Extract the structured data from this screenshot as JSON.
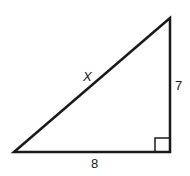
{
  "diagram": {
    "type": "right-triangle",
    "shape": {
      "vertices": {
        "bottom_left": [
          14,
          152
        ],
        "top_right": [
          170,
          18
        ],
        "bottom_right": [
          170,
          152
        ]
      },
      "right_angle_at": "bottom_right",
      "stroke_color": "#1a1a1a",
      "fill_color": "#ffffff"
    },
    "labels": {
      "hypotenuse": "X",
      "vertical_leg": "7",
      "horizontal_leg": "8"
    }
  }
}
